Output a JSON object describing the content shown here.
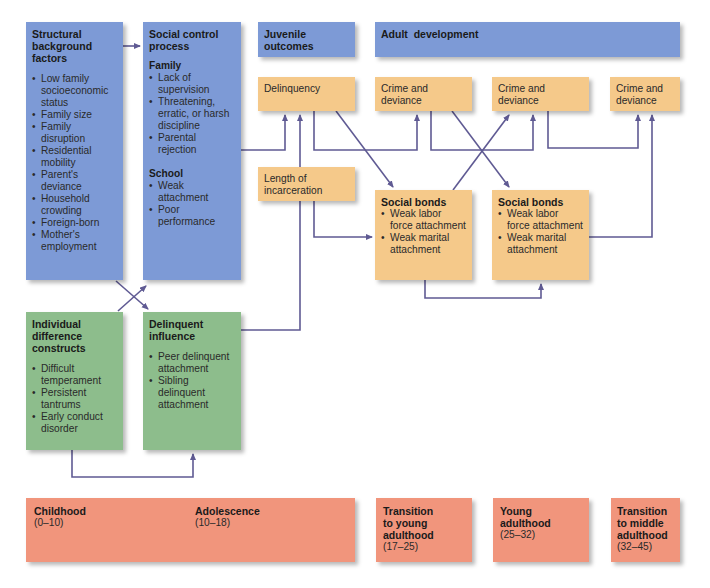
{
  "boxes": {
    "structural": {
      "title": "Structural background factors",
      "items": [
        "Low family socioeconomic status",
        "Family size",
        "Family disruption",
        "Residential mobility",
        "Parent's deviance",
        "Household crowding",
        "Foreign-born",
        "Mother's employment"
      ]
    },
    "social_control": {
      "title": "Social control process",
      "family_heading": "Family",
      "family_items": [
        "Lack of supervision",
        "Threatening, erratic, or harsh discipline",
        "Parental rejection"
      ],
      "school_heading": "School",
      "school_items": [
        "Weak attachment",
        "Poor performance"
      ]
    },
    "individual": {
      "title": "Individual difference constructs",
      "items": [
        "Difficult temperament",
        "Persistent tantrums",
        "Early conduct disorder"
      ]
    },
    "delinquent_influence": {
      "title": "Delinquent influence",
      "items": [
        "Peer delinquent attachment",
        "Sibling delinquent attachment"
      ]
    },
    "juvenile_outcomes": {
      "title": "Juvenile outcomes"
    },
    "adult_development": {
      "title": "Adult  development"
    },
    "delinquency": {
      "label": "Delinquency"
    },
    "crime1": {
      "label": "Crime and deviance"
    },
    "crime2": {
      "label": "Crime and deviance"
    },
    "crime3": {
      "label": "Crime and deviance"
    },
    "incarceration": {
      "label": "Length of incarceration"
    },
    "social_bonds1": {
      "title": "Social bonds",
      "items": [
        "Weak labor force attachment",
        "Weak marital attachment"
      ]
    },
    "social_bonds2": {
      "title": "Social bonds",
      "items": [
        "Weak labor force attachment",
        "Weak marital attachment"
      ]
    }
  },
  "timeline": {
    "childhood": {
      "label": "Childhood",
      "range": "(0–10)"
    },
    "adolescence": {
      "label": "Adolescence",
      "range": "(10–18)"
    },
    "transition_young": {
      "label": "Transition to young adulthood",
      "range": "(17–25)"
    },
    "young_adulthood": {
      "label": "Young adulthood",
      "range": "(25–32)"
    },
    "transition_middle": {
      "label": "Transition to middle adulthood",
      "range": "(32–45)"
    }
  },
  "colors": {
    "blue": "#7d9ad6",
    "green": "#8dbd8c",
    "tan": "#f5c98a",
    "salmon": "#f1957c",
    "arrow": "#5f5a93"
  }
}
